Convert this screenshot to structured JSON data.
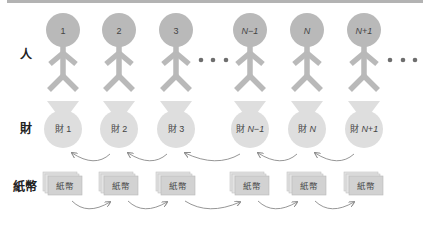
{
  "row_labels": {
    "people": "人",
    "goods": "財",
    "paper_money": "紙幣"
  },
  "people": [
    {
      "label": "1",
      "italic": false
    },
    {
      "label": "2",
      "italic": false
    },
    {
      "label": "3",
      "italic": false
    },
    {
      "label": "N−1",
      "italic": true
    },
    {
      "label": "N",
      "italic": true
    },
    {
      "label": "N+1",
      "italic": true
    }
  ],
  "goods": [
    {
      "prefix": "財",
      "label": "1",
      "italic": false
    },
    {
      "prefix": "財",
      "label": "2",
      "italic": false
    },
    {
      "prefix": "財",
      "label": "3",
      "italic": false
    },
    {
      "prefix": "財",
      "label": "N−1",
      "italic": true
    },
    {
      "prefix": "財",
      "label": "N",
      "italic": true
    },
    {
      "prefix": "財",
      "label": "N+1",
      "italic": true
    }
  ],
  "bills": [
    {
      "label": "紙幣"
    },
    {
      "label": "紙幣"
    },
    {
      "label": "紙幣"
    },
    {
      "label": "紙幣"
    },
    {
      "label": "紙幣"
    },
    {
      "label": "紙幣"
    }
  ],
  "ellipsis": "• • •",
  "colors": {
    "figure": "#b9b9b9",
    "bag": "#dedede",
    "bill_face": "#d2d2d2",
    "bill_back": "#e3e3e3",
    "arrow": "#8a8a8a",
    "dots": "#6e6e6e",
    "topbar": "#b3b3b3"
  }
}
